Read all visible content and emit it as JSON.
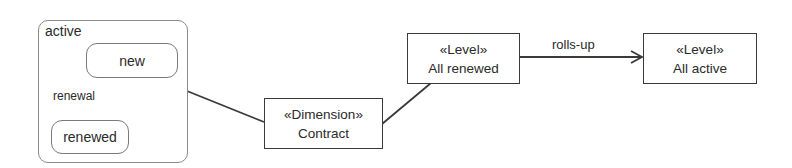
{
  "diagram": {
    "composite_state": {
      "label": "active",
      "states": [
        {
          "id": "new",
          "label": "new"
        },
        {
          "id": "renewed",
          "label": "renewed"
        }
      ],
      "transition": {
        "from": "new",
        "to": "renewed",
        "label": "renewal"
      }
    },
    "dimension": {
      "stereotype": "«Dimension»",
      "name": "Contract"
    },
    "levels": [
      {
        "id": "all-renewed",
        "stereotype": "«Level»",
        "name": "All renewed"
      },
      {
        "id": "all-active",
        "stereotype": "«Level»",
        "name": "All active"
      }
    ],
    "relationships": [
      {
        "from": "active",
        "to": "Contract",
        "type": "association"
      },
      {
        "from": "Contract",
        "to": "All renewed",
        "type": "association"
      },
      {
        "from": "All renewed",
        "to": "All active",
        "type": "directed",
        "label": "rolls-up"
      }
    ],
    "colors": {
      "line": "#3a3a3a",
      "thin_line": "#7a7a7a",
      "text": "#2a2a2a"
    }
  }
}
